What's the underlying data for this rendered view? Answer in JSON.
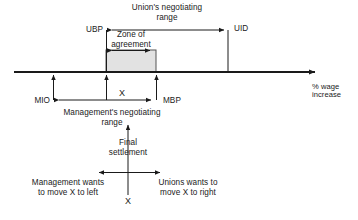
{
  "diagram": {
    "axis": {
      "caption_line1": "% wage",
      "caption_line2": "increase"
    },
    "labels": {
      "ubp": "UBP",
      "uid": "UID",
      "mio": "MIO",
      "mbp": "MBP",
      "x_upper": "X",
      "x_lower": "X",
      "union_range_line1": "Union's negotiating",
      "union_range_line2": "range",
      "zone_line1": "Zone of",
      "zone_line2": "agreement",
      "mgmt_range_line1": "Management's negotiating",
      "mgmt_range_line2": "range",
      "final_line1": "Final",
      "final_line2": "settlement",
      "mgmt_wants_line1": "Management wants",
      "mgmt_wants_line2": "to move X to left",
      "union_wants_line1": "Unions  wants to",
      "union_wants_line2": "move X to right"
    },
    "colors": {
      "stroke": "#1a1a1a",
      "zone_fill": "#e2e2e2",
      "zone_stroke": "#4d4d4d",
      "background": "#ffffff"
    },
    "geometry": {
      "axis_y": 72,
      "axis_x_start": 14,
      "axis_x_end": 322,
      "ubp_x": 106,
      "mbp_x": 156,
      "mio_x": 53,
      "uid_x": 228,
      "settlement_x": 128,
      "zone_top_y": 50,
      "union_arrow_y": 30,
      "mgmt_arrow_y": 100
    }
  }
}
